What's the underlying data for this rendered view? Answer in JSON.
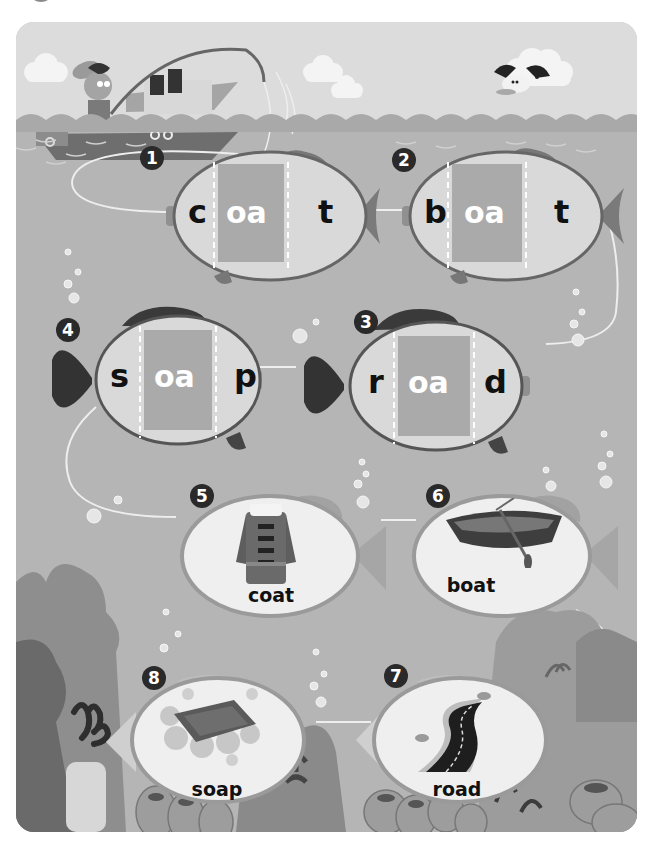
{
  "activity": {
    "title_visible": false,
    "theme": "fishing phonics worksheet",
    "colors": {
      "sky": "#dcdcdc",
      "sea": "#b5b5b5",
      "fish_body": "#d9d9d9",
      "fish_outline": "#666666",
      "vowel_box": "#aaaaaa",
      "badge": "#2a2a2a",
      "picture_fish_body": "#efefef"
    }
  },
  "word_fish": [
    {
      "number": "1",
      "onset": "c",
      "vowel": "oa",
      "coda": "t"
    },
    {
      "number": "2",
      "onset": "b",
      "vowel": "oa",
      "coda": "t"
    },
    {
      "number": "3",
      "onset": "r",
      "vowel": "oa",
      "coda": "d"
    },
    {
      "number": "4",
      "onset": "s",
      "vowel": "oa",
      "coda": "p"
    }
  ],
  "picture_fish": [
    {
      "number": "5",
      "word": "coat",
      "picture": "coat-icon"
    },
    {
      "number": "6",
      "word": "boat",
      "picture": "rowboat-icon"
    },
    {
      "number": "7",
      "word": "road",
      "picture": "road-icon"
    },
    {
      "number": "8",
      "word": "soap",
      "picture": "soap-icon"
    }
  ]
}
